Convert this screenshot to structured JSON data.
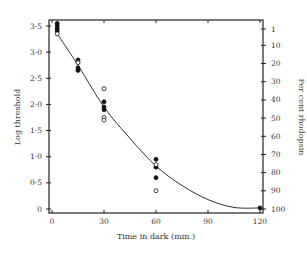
{
  "chart_data": {
    "type": "scatter",
    "title": "",
    "xlabel": "Time in dark (min.)",
    "ylabel": "Log threshold",
    "y2label": "Per cent rhodopsin",
    "xlim": [
      0,
      120
    ],
    "ylim": [
      0,
      3.5
    ],
    "x_ticks": [
      0,
      30,
      60,
      90,
      120
    ],
    "x_tick_labels": [
      "0",
      "30",
      "60",
      "90",
      "120"
    ],
    "y_ticks": [
      0,
      0.5,
      1.0,
      1.5,
      2.0,
      2.5,
      3.0,
      3.5
    ],
    "y_tick_labels": [
      "0",
      "0·5",
      "1·0",
      "1·5",
      "2·0",
      "2·5",
      "3·0",
      "3·5"
    ],
    "y2_ticks": [
      1,
      10,
      20,
      30,
      40,
      50,
      60,
      70,
      80,
      90,
      100
    ],
    "y2_tick_labels": [
      "1",
      "10",
      "20",
      "30",
      "40",
      "50",
      "60",
      "70",
      "80",
      "90",
      "100"
    ],
    "grid": false,
    "legend": null,
    "series": [
      {
        "name": "filled circles",
        "marker": "filled-circle",
        "points": [
          {
            "x": 3,
            "y": 3.55
          },
          {
            "x": 3,
            "y": 3.5
          },
          {
            "x": 3,
            "y": 3.45
          },
          {
            "x": 3,
            "y": 3.4
          },
          {
            "x": 15,
            "y": 2.85
          },
          {
            "x": 15,
            "y": 2.7
          },
          {
            "x": 15,
            "y": 2.65
          },
          {
            "x": 30,
            "y": 2.05
          },
          {
            "x": 30,
            "y": 1.95
          },
          {
            "x": 30,
            "y": 1.9
          },
          {
            "x": 60,
            "y": 0.95
          },
          {
            "x": 60,
            "y": 0.8
          },
          {
            "x": 60,
            "y": 0.6
          },
          {
            "x": 120,
            "y": 0.02
          }
        ]
      },
      {
        "name": "open circles",
        "marker": "open-circle",
        "points": [
          {
            "x": 3,
            "y": 3.35
          },
          {
            "x": 15,
            "y": 2.8
          },
          {
            "x": 30,
            "y": 2.3
          },
          {
            "x": 30,
            "y": 1.75
          },
          {
            "x": 30,
            "y": 1.7
          },
          {
            "x": 60,
            "y": 0.85
          },
          {
            "x": 60,
            "y": 0.35
          }
        ]
      }
    ],
    "fitted_curve": {
      "name": "theoretical curve",
      "points": [
        {
          "x": 3,
          "y": 3.35
        },
        {
          "x": 15,
          "y": 2.75
        },
        {
          "x": 30,
          "y": 1.95
        },
        {
          "x": 45,
          "y": 1.35
        },
        {
          "x": 60,
          "y": 0.82
        },
        {
          "x": 75,
          "y": 0.45
        },
        {
          "x": 90,
          "y": 0.18
        },
        {
          "x": 105,
          "y": 0.03
        },
        {
          "x": 120,
          "y": 0.02
        }
      ]
    }
  },
  "labels": {
    "xlabel": "Time in dark (min.)",
    "ylabel": "Log threshold",
    "y2label": "Per cent rhodopsin"
  }
}
